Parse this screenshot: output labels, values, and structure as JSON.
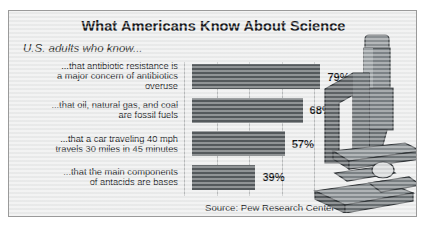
{
  "header": {
    "title": "What Americans Know About Science",
    "subtitle": "U.S. adults who know..."
  },
  "source": {
    "text": "Source: Pew Research Center"
  },
  "illustration": {
    "name": "microscope-illustration"
  },
  "colors": {
    "panel_background": "#eceded",
    "panel_border": "#9a9a9a",
    "bar_fill": "#555a5d",
    "gridline": "#b9bbbc",
    "text": "#1a1c1f"
  },
  "chart_data": {
    "type": "bar",
    "orientation": "horizontal",
    "title": "What Americans Know About Science",
    "subtitle": "U.S. adults who know...",
    "categories": [
      "...that antibiotic resistance is a major concern of antibiotics overuse",
      "...that oil, natural gas, and coal are fossil fuels",
      "...that a car traveling 40 mph travels 30 miles in 45 minutes",
      "...that the main components of antacids are bases"
    ],
    "category_lines": [
      [
        "...that antibiotic resistance is",
        "a major concern of antibiotics",
        "overuse"
      ],
      [
        "...that oil, natural gas, and coal",
        "are fossil fuels"
      ],
      [
        "...that a car traveling 40 mph",
        "travels 30 miles in 45 minutes"
      ],
      [
        "...that the main components",
        "of antacids are bases"
      ]
    ],
    "values": [
      79,
      68,
      57,
      39
    ],
    "value_labels": [
      "79%",
      "68%",
      "57%",
      "39%"
    ],
    "xlabel": "",
    "ylabel": "",
    "xlim": [
      0,
      88
    ],
    "gridlines": [
      0,
      20,
      40,
      60,
      80
    ],
    "grid": true,
    "legend": false,
    "source": "Source: Pew Research Center"
  }
}
